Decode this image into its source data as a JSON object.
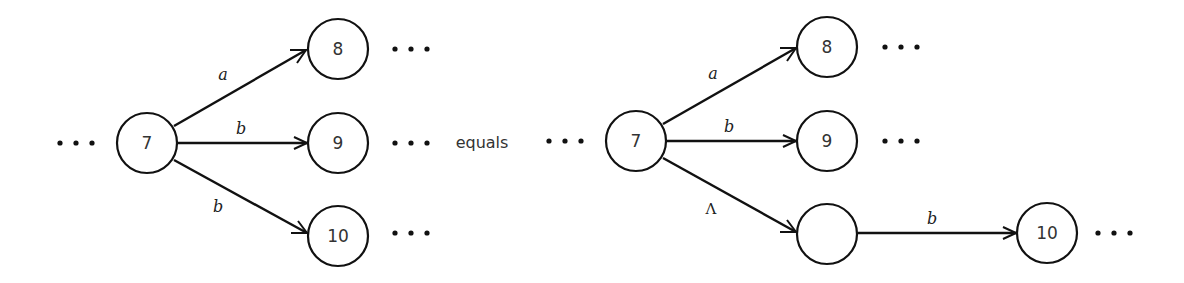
{
  "connector_word": "equals",
  "ellipsis": "• • •",
  "left_diagram": {
    "nodes": [
      {
        "id": "7",
        "label": "7"
      },
      {
        "id": "8",
        "label": "8"
      },
      {
        "id": "9",
        "label": "9"
      },
      {
        "id": "10",
        "label": "10"
      }
    ],
    "edges": [
      {
        "from": "7",
        "to": "8",
        "label": "a"
      },
      {
        "from": "7",
        "to": "9",
        "label": "b"
      },
      {
        "from": "7",
        "to": "10",
        "label": "b"
      }
    ]
  },
  "right_diagram": {
    "nodes": [
      {
        "id": "7",
        "label": "7"
      },
      {
        "id": "8",
        "label": "8"
      },
      {
        "id": "9",
        "label": "9"
      },
      {
        "id": "blank",
        "label": ""
      },
      {
        "id": "10",
        "label": "10"
      }
    ],
    "edges": [
      {
        "from": "7",
        "to": "8",
        "label": "a"
      },
      {
        "from": "7",
        "to": "9",
        "label": "b"
      },
      {
        "from": "7",
        "to": "blank",
        "label": "Λ"
      },
      {
        "from": "blank",
        "to": "10",
        "label": "b"
      }
    ]
  }
}
